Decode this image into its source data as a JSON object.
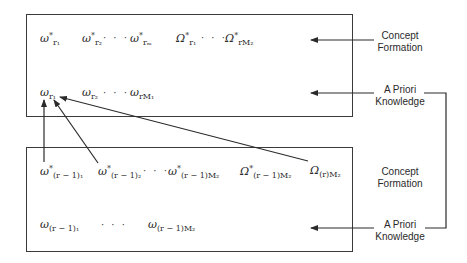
{
  "diagram": {
    "top_box": {
      "row1": [
        {
          "base": "ω",
          "sup": "*",
          "sub": "r₁"
        },
        {
          "base": "ω",
          "sup": "*",
          "sub": "r₂"
        },
        {
          "dots": "· · ·"
        },
        {
          "base": "ω",
          "sup": "*",
          "sub": "rₘ"
        },
        {
          "base": "Ω",
          "sup": "*",
          "sub": "r₁"
        },
        {
          "dots": "· · ·"
        },
        {
          "base": "Ω",
          "sup": "*",
          "sub": "rM₂"
        }
      ],
      "row2": [
        {
          "base": "ω",
          "sub": "r₁"
        },
        {
          "base": "ω",
          "sub": "r₂"
        },
        {
          "dots": "· · ·"
        },
        {
          "base": "ω",
          "sub": "rM₁"
        }
      ]
    },
    "bottom_box": {
      "row1": [
        {
          "base": "ω",
          "sup": "*",
          "sub": "(r − 1)₁"
        },
        {
          "base": "ω",
          "sup": "*",
          "sub": "(r − 1)₂"
        },
        {
          "dots": "· · ·"
        },
        {
          "base": "ω",
          "sup": "*",
          "sub": "(r − 1)M₂"
        },
        {
          "base": "Ω",
          "sup": "*",
          "sub": "(r − 1)M₂"
        },
        {
          "base": "Ω",
          "sub": "(r)M₂"
        }
      ],
      "row2": [
        {
          "base": "ω",
          "sub": "(r − 1)₁"
        },
        {
          "dots": "· · ·"
        },
        {
          "base": "ω",
          "sub": "(r − 1)M₂"
        }
      ]
    },
    "labels": {
      "top_concept": [
        "Concept",
        "Formation"
      ],
      "top_priori": [
        "A Priori",
        "Knowledge"
      ],
      "bottom_concept": [
        "Concept",
        "Formation"
      ],
      "bottom_priori": [
        "A Priori",
        "Knowledge"
      ]
    },
    "line_color": "#2a2a2a"
  }
}
